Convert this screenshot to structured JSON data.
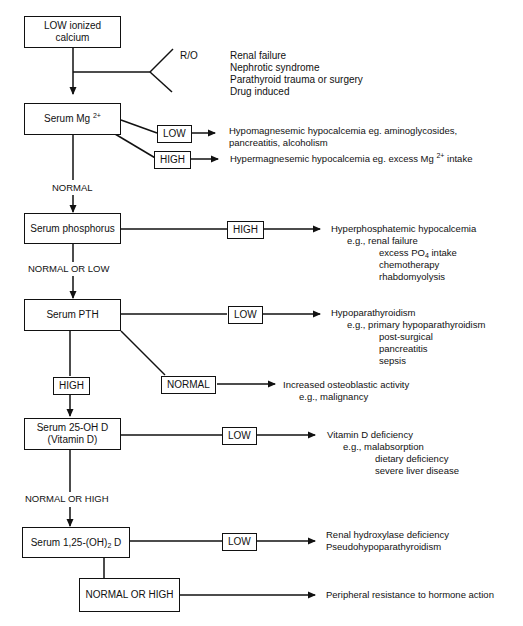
{
  "nodes": {
    "low_calcium": "LOW ionized calcium",
    "serum_mg": "Serum Mg",
    "serum_mg_sup": "2+",
    "serum_phosphorus": "Serum phosphorus",
    "serum_pth": "Serum PTH",
    "serum_25ohd_line1": "Serum 25-OH D",
    "serum_25ohd_line2": "(Vitamin D)",
    "serum_125_pre": "Serum 1,25-(OH)",
    "serum_125_sub": "2",
    "serum_125_post": " D",
    "normal_or_high_box": "NORMAL OR HIGH"
  },
  "rule_out": {
    "label": "R/O",
    "items": [
      "Renal failure",
      "Nephrotic syndrome",
      "Parathyroid trauma or surgery",
      "Drug induced"
    ]
  },
  "edge_labels": {
    "mg_low": "LOW",
    "mg_high": "HIGH",
    "mg_normal": "NORMAL",
    "phos_high": "HIGH",
    "phos_normal_low": "NORMAL OR LOW",
    "pth_low": "LOW",
    "pth_high": "HIGH",
    "pth_normal": "NORMAL",
    "vitd_low": "LOW",
    "vitd_normal_high": "NORMAL OR HIGH",
    "d125_low": "LOW"
  },
  "results": {
    "hypomag_line1": "Hypomagnesemic hypocalcemia eg. aminoglycosides,",
    "hypomag_line2": "pancreatitis, alcoholism",
    "hypermag_pre": "Hypermagnesemic hypocalcemia eg. excess Mg",
    "hypermag_sup": "2+",
    "hypermag_post": " intake",
    "hyperphos": {
      "title": "Hyperphosphatemic hypocalcemia",
      "eg": "e.g., renal failure",
      "po4_pre": "excess PO",
      "po4_sub": "4",
      "po4_post": " intake",
      "items": [
        "chemotherapy",
        "rhabdomyolysis"
      ]
    },
    "hypopara": {
      "title": "Hypoparathyroidism",
      "eg": "e.g., primary hypoparathyroidism",
      "items": [
        "post-surgical",
        "pancreatitis",
        "sepsis"
      ]
    },
    "osteoblastic": {
      "title": "Increased osteoblastic activity",
      "eg": "e.g., malignancy"
    },
    "vitd_def": {
      "title": "Vitamin D deficiency",
      "eg": "e.g., malabsorption",
      "items": [
        "dietary deficiency",
        "severe liver disease"
      ]
    },
    "renal_hydroxylase": [
      "Renal hydroxylase deficiency",
      "Pseudohypoparathyroidism"
    ],
    "peripheral": "Peripheral resistance to hormone action"
  }
}
